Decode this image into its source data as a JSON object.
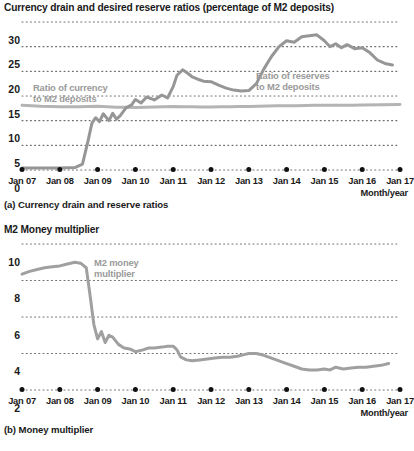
{
  "figure": {
    "panel_a": {
      "title": "Currency drain and desired reserve ratios (percentage of M2 deposits)",
      "caption": "(a) Currency drain and reserve ratios",
      "axis_name": "Month/year",
      "annotation_currency": "Ratio of currency\nto M2 deposits",
      "annotation_reserves": "Ratio of reserves\nto M2 deposits"
    },
    "panel_b": {
      "title": "M2 Money multiplier",
      "caption": "(b) Money multiplier",
      "axis_name": "Month/year",
      "annotation_multiplier": "M2 money\nmultiplier"
    }
  },
  "colors": {
    "currency_line": "#b4b4b4",
    "reserves_line": "#969696",
    "multiplier_line": "#a0a0a0",
    "gridline": "#6e6e6e",
    "text": "#1a1a1a",
    "annotation_text": "#9a9a9a",
    "tick_dot": "#111111"
  },
  "chart_data": [
    {
      "type": "line",
      "title": "Currency drain and desired reserve ratios (percentage of M2 deposits)",
      "xlabel": "Month/year",
      "ylabel": "",
      "ylim": [
        0,
        30
      ],
      "yticks": [
        0,
        5,
        10,
        15,
        20,
        25,
        30
      ],
      "xlim": [
        "Jan 07",
        "Jan 17"
      ],
      "xticks": [
        "Jan 07",
        "Jan 08",
        "Jan 09",
        "Jan 10",
        "Jan 11",
        "Jan 12",
        "Jan 13",
        "Jan 14",
        "Jan 15",
        "Jan 16",
        "Jan 17"
      ],
      "grid": "horizontal-dotted",
      "legend": "inline-annotations",
      "x_years": [
        2007.0,
        2017.0
      ],
      "series": [
        {
          "name": "Ratio of currency to M2 deposits",
          "color": "#b4b4b4",
          "x": [
            2007.0,
            2007.25,
            2007.5,
            2007.75,
            2008.0,
            2008.25,
            2008.5,
            2008.75,
            2009.0,
            2009.25,
            2009.5,
            2009.75,
            2010.0,
            2010.25,
            2010.5,
            2010.75,
            2011.0,
            2011.25,
            2011.5,
            2011.75,
            2012.0,
            2012.25,
            2012.5,
            2012.75,
            2013.0,
            2013.25,
            2013.5,
            2013.75,
            2014.0,
            2014.25,
            2014.5,
            2014.75,
            2015.0,
            2015.25,
            2015.5,
            2015.75,
            2016.0,
            2016.5,
            2017.0
          ],
          "values": [
            13.1,
            13.0,
            12.9,
            12.85,
            12.8,
            12.8,
            12.8,
            12.85,
            12.9,
            12.8,
            12.7,
            12.7,
            12.65,
            12.7,
            12.75,
            12.8,
            12.85,
            12.8,
            12.8,
            12.75,
            12.75,
            12.8,
            12.8,
            12.85,
            12.85,
            12.9,
            12.95,
            13.0,
            13.0,
            13.0,
            13.05,
            13.1,
            13.1,
            13.1,
            13.15,
            13.15,
            13.2,
            13.25,
            13.3
          ]
        },
        {
          "name": "Ratio of reserves to M2 deposits",
          "color": "#969696",
          "x": [
            2007.0,
            2007.5,
            2008.0,
            2008.4,
            2008.6,
            2008.75,
            2008.85,
            2008.95,
            2009.05,
            2009.15,
            2009.3,
            2009.4,
            2009.5,
            2009.6,
            2009.75,
            2009.9,
            2010.0,
            2010.15,
            2010.3,
            2010.5,
            2010.7,
            2010.85,
            2011.0,
            2011.1,
            2011.25,
            2011.4,
            2011.5,
            2011.65,
            2011.8,
            2012.0,
            2012.2,
            2012.4,
            2012.6,
            2012.8,
            2013.0,
            2013.2,
            2013.4,
            2013.6,
            2013.8,
            2014.0,
            2014.2,
            2014.4,
            2014.6,
            2014.8,
            2015.0,
            2015.15,
            2015.3,
            2015.45,
            2015.6,
            2015.8,
            2016.0,
            2016.2,
            2016.4,
            2016.6,
            2016.8
          ],
          "values": [
            0.4,
            0.4,
            0.4,
            0.5,
            1.2,
            6.0,
            9.5,
            10.6,
            9.8,
            11.4,
            10.0,
            11.5,
            10.3,
            11.0,
            12.6,
            13.2,
            14.3,
            13.6,
            14.8,
            14.2,
            15.2,
            14.6,
            16.9,
            19.2,
            20.3,
            19.5,
            18.9,
            18.4,
            18.0,
            17.9,
            17.2,
            16.6,
            16.2,
            16.0,
            16.1,
            17.5,
            20.5,
            23.0,
            25.0,
            26.2,
            25.9,
            27.0,
            27.2,
            27.4,
            26.2,
            25.0,
            25.6,
            24.8,
            25.4,
            24.6,
            24.8,
            23.8,
            22.3,
            21.6,
            21.3
          ]
        }
      ]
    },
    {
      "type": "line",
      "title": "M2 Money multiplier",
      "xlabel": "Month/year",
      "ylabel": "",
      "ylim": [
        2,
        10
      ],
      "yticks": [
        2,
        4,
        6,
        8,
        10
      ],
      "xlim": [
        "Jan 07",
        "Jan 17"
      ],
      "xticks": [
        "Jan 07",
        "Jan 08",
        "Jan 09",
        "Jan 10",
        "Jan 11",
        "Jan 12",
        "Jan 13",
        "Jan 14",
        "Jan 15",
        "Jan 16",
        "Jan 17"
      ],
      "grid": "horizontal-dotted",
      "legend": "inline-annotations",
      "series": [
        {
          "name": "M2 money multiplier",
          "color": "#a0a0a0",
          "x": [
            2007.0,
            2007.2,
            2007.4,
            2007.6,
            2007.8,
            2008.0,
            2008.2,
            2008.4,
            2008.55,
            2008.7,
            2008.8,
            2008.9,
            2009.0,
            2009.1,
            2009.2,
            2009.3,
            2009.4,
            2009.55,
            2009.7,
            2009.85,
            2010.0,
            2010.2,
            2010.35,
            2010.5,
            2010.7,
            2010.85,
            2011.0,
            2011.1,
            2011.2,
            2011.35,
            2011.5,
            2011.7,
            2011.9,
            2012.1,
            2012.3,
            2012.5,
            2012.7,
            2012.9,
            2013.0,
            2013.2,
            2013.4,
            2013.6,
            2013.8,
            2014.0,
            2014.2,
            2014.4,
            2014.6,
            2014.8,
            2015.0,
            2015.15,
            2015.3,
            2015.5,
            2015.7,
            2015.9,
            2016.1,
            2016.3,
            2016.5,
            2016.7
          ],
          "values": [
            8.35,
            8.5,
            8.6,
            8.7,
            8.75,
            8.8,
            8.9,
            9.0,
            8.95,
            8.7,
            7.2,
            5.6,
            4.8,
            5.2,
            4.6,
            5.0,
            4.9,
            4.5,
            4.3,
            4.25,
            4.1,
            4.2,
            4.3,
            4.3,
            4.35,
            4.4,
            4.4,
            4.2,
            3.8,
            3.65,
            3.6,
            3.65,
            3.7,
            3.75,
            3.8,
            3.8,
            3.85,
            3.95,
            4.0,
            4.0,
            3.9,
            3.75,
            3.6,
            3.45,
            3.3,
            3.15,
            3.1,
            3.1,
            3.15,
            3.1,
            3.25,
            3.15,
            3.2,
            3.25,
            3.25,
            3.3,
            3.35,
            3.45
          ]
        }
      ]
    }
  ]
}
